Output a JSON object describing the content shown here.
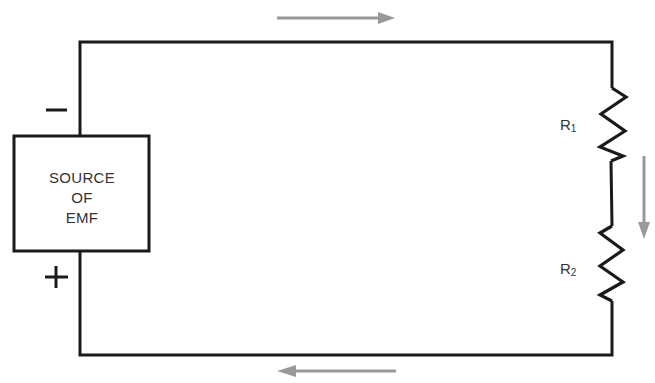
{
  "diagram": {
    "type": "series-circuit",
    "source": {
      "label_lines": [
        "SOURCE",
        "OF",
        "EMF"
      ],
      "negative_terminal": "−",
      "positive_terminal": "+"
    },
    "resistors": [
      {
        "name": "R",
        "subscript": "1"
      },
      {
        "name": "R",
        "subscript": "2"
      }
    ],
    "current_arrows": [
      {
        "position": "top",
        "direction": "right"
      },
      {
        "position": "right",
        "direction": "down"
      },
      {
        "position": "bottom",
        "direction": "left"
      }
    ],
    "colors": {
      "wire": "#1a1a1a",
      "arrow": "#999999",
      "text": "#333333"
    }
  }
}
